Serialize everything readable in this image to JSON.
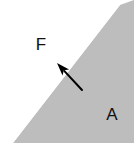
{
  "figure": {
    "width": 134,
    "height": 156,
    "background_color": "#ffffff"
  },
  "regions": [
    {
      "name": "upper-white-region",
      "label": "F",
      "fill_color": "#ffffff",
      "label_x": 41,
      "label_y": 50
    },
    {
      "name": "lower-gray-region",
      "label": "A",
      "fill_color": "#bdbdbd",
      "label_x": 112,
      "label_y": 120
    }
  ],
  "divider": {
    "name": "diagonal-boundary",
    "color": "#bdbdbd",
    "start": {
      "x": 13,
      "y": 143
    },
    "end": {
      "x": 120,
      "y": 5
    }
  },
  "arrow": {
    "name": "normal-force-arrow",
    "color": "#000000",
    "tail": {
      "x": 82,
      "y": 90
    },
    "tip": {
      "x": 57,
      "y": 63
    },
    "stroke_width": 2,
    "head_length": 13,
    "head_width": 9
  },
  "triangle": {
    "vertices": [
      {
        "x": 13,
        "y": 143
      },
      {
        "x": 134,
        "y": 143
      },
      {
        "x": 134,
        "y": 0
      },
      {
        "x": 120,
        "y": 5
      }
    ]
  }
}
